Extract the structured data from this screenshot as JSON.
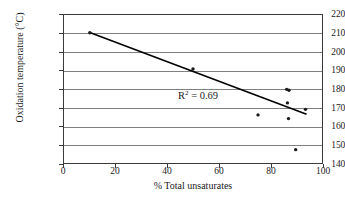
{
  "chart_data": {
    "type": "scatter",
    "title": "",
    "xlabel": "% Total unsaturates",
    "ylabel": "Oxidation temperature (°C)",
    "xlim": [
      0,
      100
    ],
    "ylim": [
      140,
      220
    ],
    "xticks": [
      0,
      20,
      40,
      60,
      80,
      100
    ],
    "yticks": [
      140,
      150,
      160,
      170,
      180,
      190,
      200,
      210,
      220
    ],
    "grid": "horizontal",
    "legend": "none",
    "marker_color": "#1a1a1a",
    "line_color": "#000000",
    "points": [
      {
        "x": 10.0,
        "y": 210.4
      },
      {
        "x": 50.0,
        "y": 190.8
      },
      {
        "x": 75.2,
        "y": 166.0
      },
      {
        "x": 86.3,
        "y": 179.8
      },
      {
        "x": 87.2,
        "y": 179.3
      },
      {
        "x": 86.6,
        "y": 172.5
      },
      {
        "x": 87.0,
        "y": 164.0
      },
      {
        "x": 93.6,
        "y": 169.0
      },
      {
        "x": 89.8,
        "y": 147.2
      }
    ],
    "trendline": {
      "x_start": 10.0,
      "y_start": 210.6,
      "x_end": 94.0,
      "y_end": 166.4
    },
    "annotations": [
      {
        "name": "r-squared",
        "prefix": "R",
        "exponent": "2",
        "suffix": " = 0.69"
      }
    ]
  },
  "axis": {
    "y_labels": [
      "220",
      "210",
      "200",
      "190",
      "180",
      "170",
      "160",
      "150",
      "140"
    ],
    "x_labels": [
      "0",
      "20",
      "40",
      "60",
      "80",
      "100"
    ]
  }
}
